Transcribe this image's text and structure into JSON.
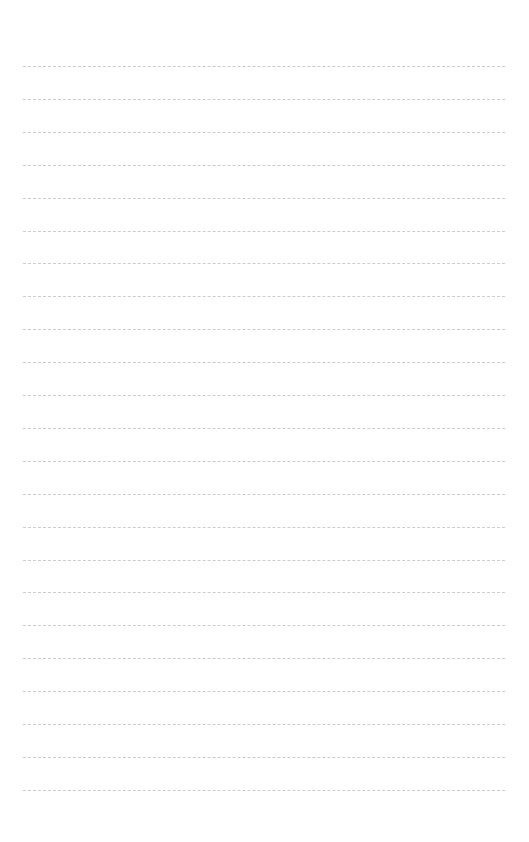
{
  "page": {
    "type": "lined-paper",
    "background_color": "#ffffff",
    "line_color": "#cdcdcd",
    "line_count": 23,
    "first_line_y": 66,
    "line_spacing": 32.9,
    "line_left": 23,
    "line_right": 505
  }
}
